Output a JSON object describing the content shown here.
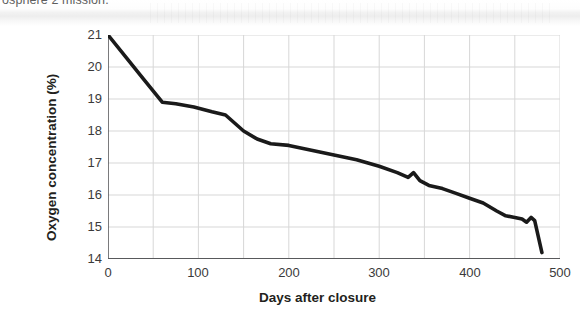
{
  "page": {
    "cut_off_text": "osphere 2 mission."
  },
  "chart_data": {
    "type": "line",
    "title": "",
    "xlabel": "Days after closure",
    "ylabel": "Oxygen concentration (%)",
    "xlim": [
      0,
      500
    ],
    "ylim": [
      14,
      21
    ],
    "xticks": [
      0,
      100,
      200,
      300,
      400,
      500
    ],
    "yticks": [
      14,
      15,
      16,
      17,
      18,
      19,
      20,
      21
    ],
    "grid": true,
    "legend": false,
    "line_color": "#1a1a1a",
    "series": [
      {
        "name": "Oxygen concentration",
        "x": [
          0,
          20,
          40,
          60,
          75,
          95,
          115,
          130,
          140,
          150,
          165,
          180,
          200,
          225,
          250,
          275,
          300,
          320,
          332,
          338,
          345,
          355,
          370,
          385,
          400,
          415,
          430,
          440,
          450,
          458,
          463,
          468,
          472,
          476,
          480
        ],
        "y": [
          21.0,
          20.3,
          19.6,
          18.9,
          18.85,
          18.75,
          18.6,
          18.5,
          18.25,
          18.0,
          17.75,
          17.6,
          17.55,
          17.4,
          17.25,
          17.1,
          16.9,
          16.7,
          16.55,
          16.7,
          16.45,
          16.3,
          16.2,
          16.05,
          15.9,
          15.75,
          15.5,
          15.35,
          15.3,
          15.25,
          15.15,
          15.3,
          15.2,
          14.7,
          14.2
        ]
      }
    ]
  }
}
